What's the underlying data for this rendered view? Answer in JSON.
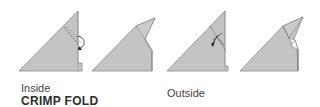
{
  "figure": {
    "title": "CRIMP FOLD",
    "captions": {
      "inside": "Inside",
      "outside": "Outside"
    },
    "steps": [
      {
        "id": "inside-step-1",
        "description": "Triangle with dashed fold line and curved arrow indicating inside crimp fold"
      },
      {
        "id": "inside-step-2",
        "description": "Result of inside crimp fold, tip folded inside"
      },
      {
        "id": "outside-step-1",
        "description": "Triangle with fold lines and arrow indicating outside crimp fold"
      },
      {
        "id": "outside-step-2",
        "description": "Result of outside crimp fold, tip wrapped outside"
      }
    ],
    "colors": {
      "paper_fill": "#c4c4c4",
      "paper_edge": "#8a8a8a",
      "fold_line": "#555555",
      "arrow": "#222222",
      "text": "#3a3a3a"
    }
  }
}
